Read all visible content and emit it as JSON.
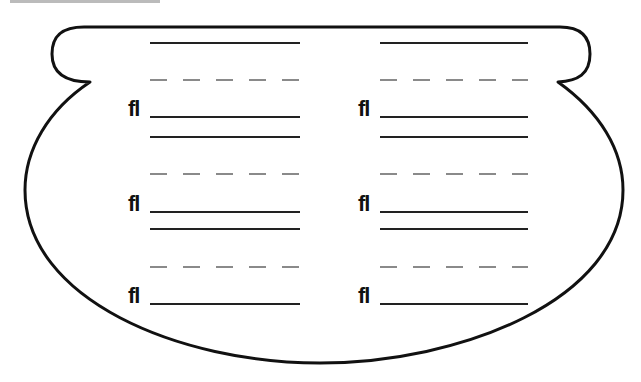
{
  "worksheet": {
    "shape": "pot",
    "stroke_color": "#111111",
    "line_color": "#222222",
    "dash_color": "#8a8a8a",
    "columns": [
      {
        "id": "left",
        "rows": [
          {
            "blend": "fl"
          },
          {
            "blend": "fl"
          },
          {
            "blend": "fl"
          }
        ]
      },
      {
        "id": "right",
        "rows": [
          {
            "blend": "fl"
          },
          {
            "blend": "fl"
          },
          {
            "blend": "fl"
          }
        ]
      }
    ]
  }
}
